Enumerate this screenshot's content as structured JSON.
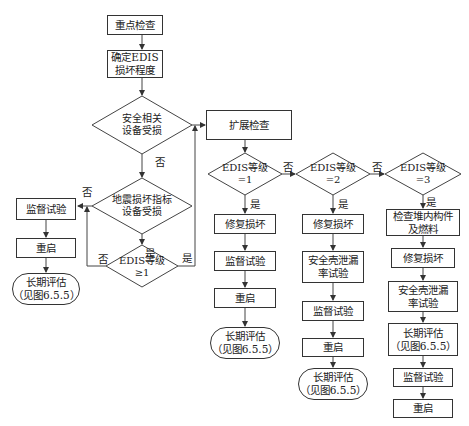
{
  "nodes": {
    "key_check": "重点检查",
    "determine_edis": "确定EDIS\n损坏程度",
    "safety_damaged": "安全相关\n设备受损",
    "extended_check": "扩展检查",
    "seismic_damaged": "地震损坏指标\n设备受损",
    "edis_ge1": "EDIS等级\n≥1",
    "left_supervise": "监督试验",
    "left_restart": "重启",
    "left_longterm": "长期评估\n（见图6.5.5）",
    "edis1": "EDIS等级\n=1",
    "c1_repair": "修复损坏",
    "c1_supervise": "监督试验",
    "c1_restart": "重启",
    "c1_longterm": "长期评估\n（见图6.5.5）",
    "edis2": "EDIS等级\n=2",
    "c2_repair": "修复损坏",
    "c2_leak": "安全壳泄漏\n率试验",
    "c2_supervise": "监督试验",
    "c2_restart": "重启",
    "c2_longterm": "长期评估\n（见图6.5.5）",
    "edis3": "EDIS等级\n=3",
    "c3_inspect": "检查堆内构件\n及燃料",
    "c3_repair": "修复损坏",
    "c3_leak": "安全壳泄漏\n率试验",
    "c3_longterm": "长期评估\n（见图6.5.5）",
    "c3_supervise": "监督试验",
    "c3_restart": "重启"
  },
  "edge_labels": {
    "yes": "是",
    "no": "否"
  }
}
